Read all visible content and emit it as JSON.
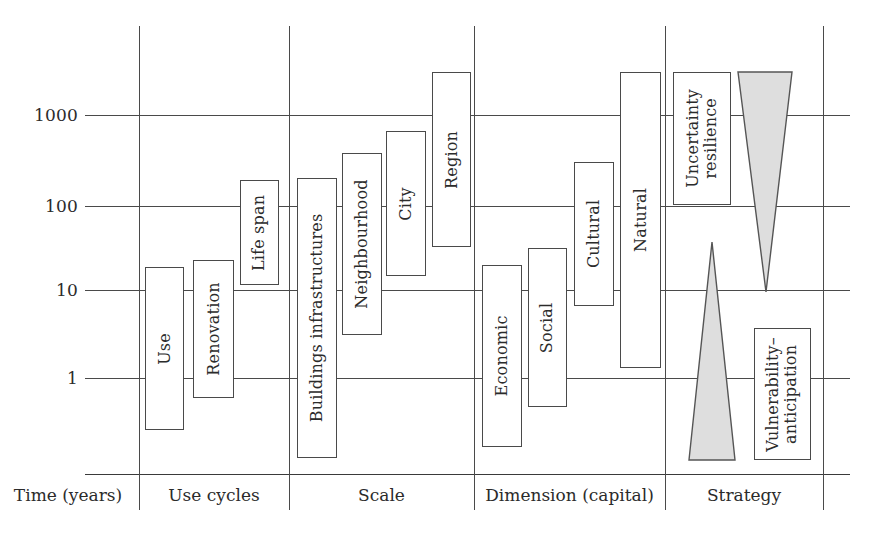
{
  "figure": {
    "type": "diagram",
    "axis": {
      "label": "Time (years)",
      "scale": "log10",
      "ticks": [
        {
          "value": "1000",
          "y": 115
        },
        {
          "value": "100",
          "y": 206
        },
        {
          "value": "10",
          "y": 290
        },
        {
          "value": "1",
          "y": 378
        }
      ]
    },
    "categories": [
      {
        "label": "Time (years)",
        "x_center": 68
      },
      {
        "label": "Use cycles",
        "x_center": 214
      },
      {
        "label": "Scale",
        "x_center": 381
      },
      {
        "label": "Dimension (capital)",
        "x_center": 570
      },
      {
        "label": "Strategy",
        "x_center": 744
      }
    ],
    "dividers_x": [
      139,
      289,
      474,
      665,
      823
    ],
    "gridlines_x_start": 85,
    "gridlines_x_end": 850,
    "baseline_y": 474,
    "dividers_y_top": 26,
    "dividers_y_bottom": 510,
    "colors": {
      "line": "#4a4a4a",
      "box_fill": "#ffffff",
      "triangle_fill": "#dedede",
      "triangle_stroke": "#555555",
      "text": "#2b2b2b"
    },
    "boxes": [
      {
        "id": "use",
        "label": "Use",
        "group": "Use cycles",
        "x": 145,
        "y": 267,
        "w": 39,
        "h": 163,
        "lines": 1
      },
      {
        "id": "renovation",
        "label": "Renovation",
        "group": "Use cycles",
        "x": 193,
        "y": 260,
        "w": 41,
        "h": 138,
        "lines": 1
      },
      {
        "id": "life-span",
        "label": "Life span",
        "group": "Use cycles",
        "x": 240,
        "y": 180,
        "w": 39,
        "h": 105,
        "lines": 1
      },
      {
        "id": "buildings-infrastructures",
        "label": "Buildings infrastructures",
        "group": "Scale",
        "x": 297,
        "y": 178,
        "w": 40,
        "h": 280,
        "lines": 1
      },
      {
        "id": "neighbourhood",
        "label": "Neighbourhood",
        "group": "Scale",
        "x": 342,
        "y": 153,
        "w": 40,
        "h": 182,
        "lines": 1
      },
      {
        "id": "city",
        "label": "City",
        "group": "Scale",
        "x": 386,
        "y": 131,
        "w": 40,
        "h": 145,
        "lines": 1
      },
      {
        "id": "region",
        "label": "Region",
        "group": "Scale",
        "x": 432,
        "y": 72,
        "w": 39,
        "h": 175,
        "lines": 1
      },
      {
        "id": "economic",
        "label": "Economic",
        "group": "Dimension (capital)",
        "x": 482,
        "y": 265,
        "w": 40,
        "h": 182,
        "lines": 1
      },
      {
        "id": "social",
        "label": "Social",
        "group": "Dimension (capital)",
        "x": 528,
        "y": 248,
        "w": 39,
        "h": 159,
        "lines": 1
      },
      {
        "id": "cultural",
        "label": "Cultural",
        "group": "Dimension (capital)",
        "x": 574,
        "y": 162,
        "w": 40,
        "h": 144,
        "lines": 1
      },
      {
        "id": "natural",
        "label": "Natural",
        "group": "Dimension (capital)",
        "x": 620,
        "y": 72,
        "w": 41,
        "h": 296,
        "lines": 1
      },
      {
        "id": "uncertainty-resilience",
        "label": "Uncertainty\nresilience",
        "group": "Strategy",
        "x": 673,
        "y": 72,
        "w": 58,
        "h": 133,
        "lines": 2
      },
      {
        "id": "vulnerability-anticipation",
        "label": "Vulnerability–\nanticipation",
        "group": "Strategy",
        "x": 754,
        "y": 328,
        "w": 57,
        "h": 132,
        "lines": 2
      }
    ],
    "triangles": [
      {
        "id": "uncertainty-resilience-triangle",
        "direction": "down",
        "x": 738,
        "y": 72,
        "w": 54,
        "h": 220
      },
      {
        "id": "vulnerability-anticipation-triangle",
        "direction": "up",
        "x": 688,
        "y": 242,
        "w": 48,
        "h": 218
      }
    ]
  }
}
